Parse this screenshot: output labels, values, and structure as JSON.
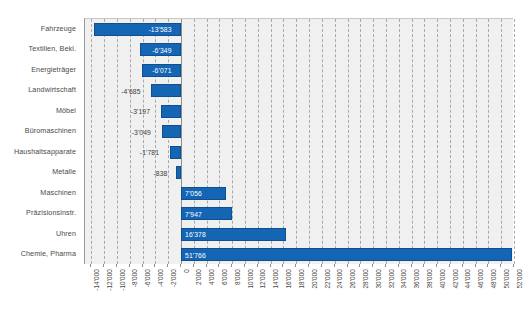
{
  "chart_data": {
    "type": "bar",
    "orientation": "horizontal",
    "title": "",
    "subtitle": "",
    "xlabel": "",
    "ylabel": "",
    "grid": true,
    "legend": null,
    "xlim": [
      -15000,
      52000
    ],
    "categories": [
      "Fahrzeuge",
      "Textilien, Bekl.",
      "Energieträger",
      "Landwirtschaft",
      "Möbel",
      "Büromaschinen",
      "Haushaltsapparate",
      "Metalle",
      "Maschinen",
      "Präzisionsinstr.",
      "Uhren",
      "Chemie, Pharma"
    ],
    "values": [
      -13583,
      -6349,
      -6071,
      -4685,
      -3197,
      -3049,
      -1781,
      -838,
      7056,
      7947,
      16378,
      51766
    ],
    "value_labels": [
      "-13'583",
      "-6'349",
      "-6'071",
      "-4'685",
      "-3'197",
      "-3'049",
      "-1'781",
      "-838",
      "7'056",
      "7'947",
      "16'378",
      "51'766"
    ],
    "xticks": [
      -14000,
      -12000,
      -10000,
      -8000,
      -6000,
      -4000,
      -2000,
      0,
      2000,
      4000,
      6000,
      8000,
      10000,
      12000,
      14000,
      16000,
      18000,
      20000,
      22000,
      24000,
      26000,
      28000,
      30000,
      32000,
      34000,
      36000,
      38000,
      40000,
      42000,
      44000,
      46000,
      48000,
      50000,
      52000
    ],
    "xtick_labels": [
      "-14'000",
      "-12'000",
      "-10'000",
      "-8'000",
      "-6'000",
      "-4'000",
      "-2'000",
      "0",
      "2'000",
      "4'000",
      "6'000",
      "8'000",
      "10'000",
      "12'000",
      "14'000",
      "16'000",
      "18'000",
      "20'000",
      "22'000",
      "24'000",
      "26'000",
      "28'000",
      "30'000",
      "32'000",
      "34'000",
      "36'000",
      "38'000",
      "40'000",
      "42'000",
      "44'000",
      "46'000",
      "48'000",
      "50'000",
      "52'000"
    ],
    "colors": {
      "bar": "#1565b5",
      "bar_border": "#0f4f8f",
      "plot_background": "#f0f0f0",
      "gridline": "#a9a9a9",
      "axis": "#8e8e8e",
      "label_text": "#4a4a4a",
      "value_inside": "#ffffff",
      "value_outside": "#3c3c3c"
    }
  }
}
